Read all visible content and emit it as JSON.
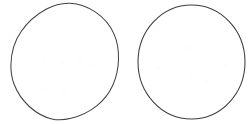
{
  "canvas": {
    "width": 251,
    "height": 124,
    "background_color": "#ffffff",
    "description": "Two empty circle outlines side by side on a plain white background"
  },
  "style": {
    "stroke_color_hand_drawn": "#434343",
    "stroke_color_geometric": "#3d3d3d",
    "stroke_width": 1.05,
    "fill": "none"
  },
  "shapes": [
    {
      "id": "circle-left",
      "label": "Left circle",
      "kind": "circle",
      "rendering": "hand-drawn",
      "center_x": 64.5,
      "center_y": 61.5,
      "radius_x": 54,
      "radius_y": 58.5,
      "bounds": {
        "left": 10.5,
        "top": 3,
        "right": 118.5,
        "bottom": 120
      },
      "stroke_color": "#434343",
      "fill": "none",
      "path": "M 10.9 64.8 C 11.2 52.6 14.6 41.0 21.0 31.8 C 27.3 22.5 36.1 14.7 46.0 9.3 C 53.4 5.2 61.6 2.9 70.0 3.2 C 79.2 3.6 88.0 7.0 95.6 12.1 C 103.8 17.6 110.3 25.4 114.2 34.4 C 117.5 42.1 118.7 50.6 118.5 59.0 C 118.3 68.0 116.5 77.0 112.8 85.2 C 109.2 93.2 103.6 100.3 96.7 105.8 C 89.3 111.7 80.4 115.9 71.1 118.3 C 64.8 119.9 58.1 120.4 51.8 118.9 C 43.6 117.0 36.1 112.6 29.8 107.0 C 22.9 100.8 17.4 93.0 14.1 84.3 C 11.7 78.1 10.8 71.4 10.9 64.8 Z"
    },
    {
      "id": "circle-right",
      "label": "Right circle",
      "kind": "circle",
      "rendering": "geometric",
      "center_x": 191.5,
      "center_y": 62.0,
      "radius_x": 53.5,
      "radius_y": 57.0,
      "bounds": {
        "left": 138,
        "top": 5,
        "right": 245,
        "bottom": 119
      },
      "stroke_color": "#3d3d3d",
      "fill": "none"
    }
  ],
  "speckles": [
    {
      "x": 42,
      "y": 58,
      "w": 3,
      "h": 4
    },
    {
      "x": 60,
      "y": 60,
      "w": 4,
      "h": 5
    },
    {
      "x": 78,
      "y": 59,
      "w": 4,
      "h": 4
    },
    {
      "x": 92,
      "y": 62,
      "w": 3,
      "h": 5
    },
    {
      "x": 44,
      "y": 88,
      "w": 3,
      "h": 3
    },
    {
      "x": 62,
      "y": 89,
      "w": 4,
      "h": 3
    },
    {
      "x": 155,
      "y": 66,
      "w": 5,
      "h": 4
    },
    {
      "x": 186,
      "y": 46,
      "w": 6,
      "h": 3
    },
    {
      "x": 189,
      "y": 71,
      "w": 2,
      "h": 5
    },
    {
      "x": 203,
      "y": 78,
      "w": 6,
      "h": 6
    },
    {
      "x": 225,
      "y": 62,
      "w": 3,
      "h": 6
    }
  ]
}
